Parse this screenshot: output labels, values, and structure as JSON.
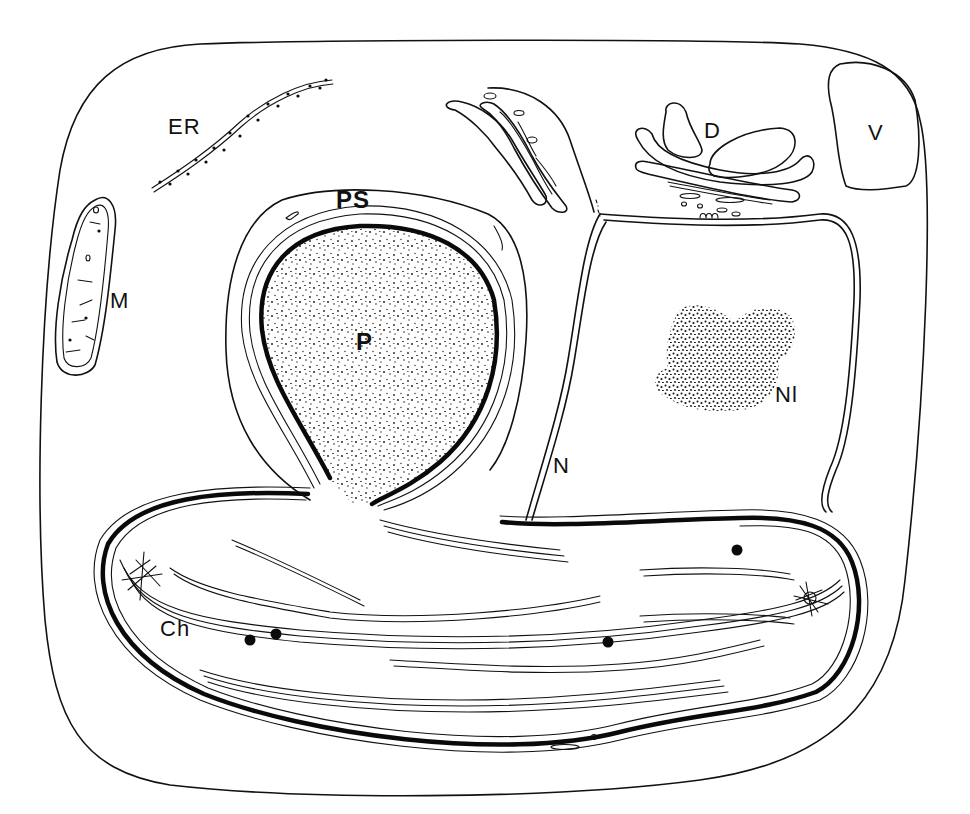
{
  "figure": {
    "type": "cell-diagram",
    "background": "#ffffff",
    "ink": "#111111",
    "labels": {
      "er": "ER",
      "ps": "PS",
      "p": "P",
      "m": "M",
      "d": "D",
      "v": "V",
      "nl": "Nl",
      "n": "N",
      "ch": "Ch"
    }
  }
}
